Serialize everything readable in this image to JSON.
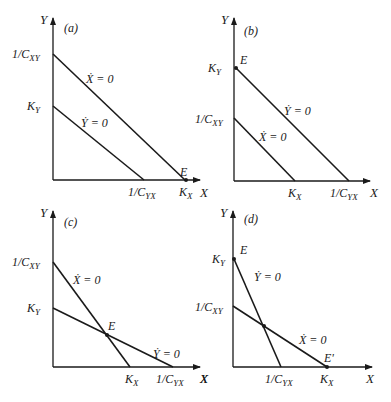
{
  "figure": {
    "axis_x_label": "X",
    "axis_y_label": "Y"
  },
  "panels": [
    {
      "id": "a",
      "label": "(a)",
      "y_ticks": [
        {
          "main": "1/C",
          "sub": "XY"
        },
        {
          "main": "K",
          "sub": "Y"
        }
      ],
      "x_ticks": [
        {
          "main": "1/C",
          "sub": "YX"
        },
        {
          "main": "K",
          "sub": "X"
        }
      ],
      "lines": [
        {
          "eq": "Ẋ = 0"
        },
        {
          "eq": "Ẏ = 0"
        }
      ],
      "points": [
        {
          "name": "E"
        }
      ]
    },
    {
      "id": "b",
      "label": "(b)",
      "y_ticks": [
        {
          "main": "K",
          "sub": "Y"
        },
        {
          "main": "1/C",
          "sub": "XY"
        }
      ],
      "x_ticks": [
        {
          "main": "K",
          "sub": "X"
        },
        {
          "main": "1/C",
          "sub": "YX"
        }
      ],
      "lines": [
        {
          "eq": "Ẏ = 0"
        },
        {
          "eq": "Ẋ = 0"
        }
      ],
      "points": [
        {
          "name": "E"
        }
      ]
    },
    {
      "id": "c",
      "label": "(c)",
      "y_ticks": [
        {
          "main": "1/C",
          "sub": "XY"
        },
        {
          "main": "K",
          "sub": "Y"
        }
      ],
      "x_ticks": [
        {
          "main": "K",
          "sub": "X"
        },
        {
          "main": "1/C",
          "sub": "YX"
        }
      ],
      "lines": [
        {
          "eq": "Ẋ = 0"
        },
        {
          "eq": "Ẏ = 0"
        }
      ],
      "points": [
        {
          "name": "E"
        }
      ]
    },
    {
      "id": "d",
      "label": "(d)",
      "y_ticks": [
        {
          "main": "K",
          "sub": "Y"
        },
        {
          "main": "1/C",
          "sub": "XY"
        }
      ],
      "x_ticks": [
        {
          "main": "1/C",
          "sub": "YX"
        },
        {
          "main": "K",
          "sub": "X"
        }
      ],
      "lines": [
        {
          "eq": "Ẏ = 0"
        },
        {
          "eq": "Ẋ = 0"
        }
      ],
      "points": [
        {
          "name": "E"
        },
        {
          "name": "E'"
        }
      ]
    }
  ]
}
